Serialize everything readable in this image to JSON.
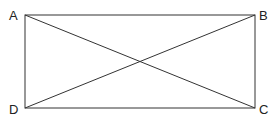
{
  "diagram": {
    "type": "rectangle-with-diagonals",
    "vertices": [
      {
        "label": "A",
        "x": 25,
        "y": 15
      },
      {
        "label": "B",
        "x": 255,
        "y": 15
      },
      {
        "label": "C",
        "x": 255,
        "y": 108
      },
      {
        "label": "D",
        "x": 25,
        "y": 108
      }
    ],
    "diagonals": [
      "AC",
      "BD"
    ],
    "stroke_color": "#333333"
  }
}
